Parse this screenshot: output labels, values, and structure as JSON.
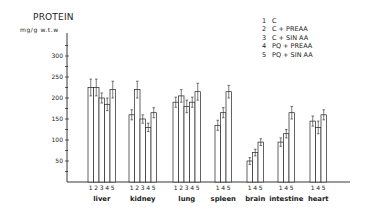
{
  "chart_data": {
    "type": "bar",
    "title": "PROTEIN",
    "ylabel": "mg/g w.t.w",
    "xlabel": "",
    "ylim": [
      0,
      350
    ],
    "yticks": [
      50,
      100,
      150,
      200,
      250,
      300
    ],
    "grid": false,
    "legend_position": "top-right",
    "legend": [
      {
        "id": "1",
        "label": "C"
      },
      {
        "id": "2",
        "label": "C + PREAA"
      },
      {
        "id": "3",
        "label": "C + SIN AA"
      },
      {
        "id": "4",
        "label": "PQ + PREAA"
      },
      {
        "id": "5",
        "label": "PQ + SIN AA"
      }
    ],
    "categories": [
      "liver",
      "kidney",
      "lung",
      "spleen",
      "brain",
      "intestine",
      "heart"
    ],
    "groups": [
      {
        "category": "liver",
        "series": [
          "1",
          "2",
          "3",
          "4",
          "5"
        ],
        "values": [
          225,
          225,
          200,
          185,
          220
        ],
        "errors": [
          20,
          20,
          12,
          15,
          20
        ]
      },
      {
        "category": "kidney",
        "series": [
          "1",
          "2",
          "3",
          "4",
          "5"
        ],
        "values": [
          160,
          220,
          150,
          130,
          165
        ],
        "errors": [
          12,
          20,
          10,
          10,
          12
        ]
      },
      {
        "category": "lung",
        "series": [
          "1",
          "2",
          "3",
          "4",
          "5"
        ],
        "values": [
          190,
          205,
          180,
          190,
          215
        ],
        "errors": [
          12,
          15,
          15,
          12,
          20
        ]
      },
      {
        "category": "spleen",
        "series": [
          "1",
          "4",
          "5"
        ],
        "values": [
          135,
          165,
          215
        ],
        "errors": [
          12,
          12,
          15
        ]
      },
      {
        "category": "brain",
        "series": [
          "1",
          "4",
          "5"
        ],
        "values": [
          50,
          70,
          95
        ],
        "errors": [
          8,
          8,
          8
        ]
      },
      {
        "category": "intestine",
        "series": [
          "1",
          "4",
          "5"
        ],
        "values": [
          95,
          115,
          165
        ],
        "errors": [
          10,
          10,
          15
        ]
      },
      {
        "category": "heart",
        "series": [
          "1",
          "4",
          "5"
        ],
        "values": [
          145,
          130,
          160
        ],
        "errors": [
          12,
          15,
          12
        ]
      }
    ]
  },
  "layout": {
    "axis_x": 67,
    "baseline_y": 182,
    "px_per_unit": 0.42,
    "axis_top_y": 33,
    "baseline_end_x": 350,
    "bar_width": 5.5,
    "group_starts": [
      88,
      129,
      173,
      215,
      247,
      278,
      310
    ]
  },
  "colors": {
    "ink": "#222222",
    "bar_fill": "#ffffff",
    "background": "#ffffff"
  }
}
